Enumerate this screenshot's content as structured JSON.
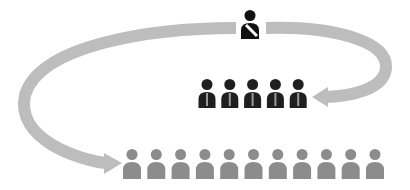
{
  "diagram": {
    "colors": {
      "background": "#ffffff",
      "arrow": "#bdbdbd",
      "leader": "#111111",
      "leader_sash": "#ffffff",
      "manager": "#1f1f1f",
      "manager_tie": "#9a9a9a",
      "staff": "#8c8c8c"
    },
    "leader": {
      "label": "",
      "count": 1,
      "icon": "person-with-sash-icon"
    },
    "managers": {
      "label": "",
      "count": 5,
      "icon": "person-with-tie-icon"
    },
    "staff": {
      "label": "",
      "count": 11,
      "icon": "person-icon"
    },
    "arrows": [
      {
        "from": "leader",
        "to": "managers",
        "direction": "clockwise-right"
      },
      {
        "from": "leader",
        "to": "staff",
        "direction": "counterclockwise-left"
      }
    ]
  }
}
